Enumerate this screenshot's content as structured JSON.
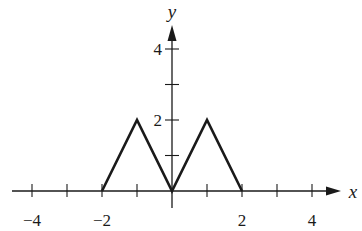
{
  "chart_data": {
    "type": "line",
    "title": "",
    "xlabel": "x",
    "ylabel": "y",
    "xlim": [
      -4.5,
      4.7
    ],
    "ylim": [
      -0.5,
      5.2
    ],
    "x_ticks": [
      -4,
      -3,
      -2,
      -1,
      1,
      2,
      3,
      4
    ],
    "x_tick_labels": [
      {
        "value": -4,
        "label": "−4"
      },
      {
        "value": -2,
        "label": "−2"
      },
      {
        "value": 2,
        "label": "2"
      },
      {
        "value": 4,
        "label": "4"
      }
    ],
    "y_ticks": [
      1,
      2,
      3,
      4
    ],
    "y_tick_labels": [
      {
        "value": 2,
        "label": "2"
      },
      {
        "value": 4,
        "label": "4"
      }
    ],
    "grid": false,
    "legend": null,
    "series": [
      {
        "name": "f(x)",
        "x": [
          -2,
          -1,
          0,
          1,
          2
        ],
        "y": [
          0,
          2,
          0,
          2,
          0
        ]
      }
    ]
  }
}
